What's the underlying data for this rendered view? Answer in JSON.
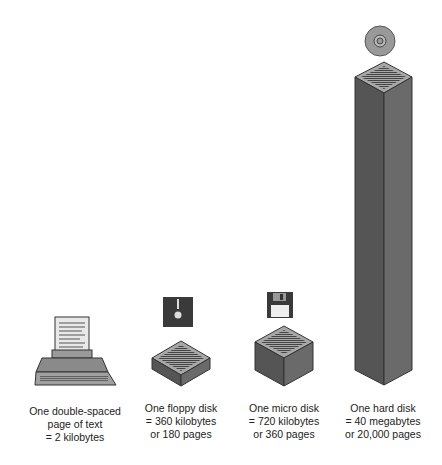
{
  "items": [
    {
      "name": "page",
      "lines": [
        "One double-spaced",
        "page of text",
        "= 2 kilobytes"
      ],
      "kilobytes": 2,
      "pages": 1
    },
    {
      "name": "floppy",
      "lines": [
        "One floppy disk",
        "= 360 kilobytes",
        "or 180 pages"
      ],
      "kilobytes": 360,
      "pages": 180
    },
    {
      "name": "micro",
      "lines": [
        "One micro disk",
        "= 720 kilobytes",
        "or 360 pages"
      ],
      "kilobytes": 720,
      "pages": 360
    },
    {
      "name": "hard",
      "lines": [
        "One hard disk",
        "= 40 megabytes",
        "or 20,000 pages"
      ],
      "kilobytes": 40000,
      "pages": 20000
    }
  ],
  "colors": {
    "block_side_dark": "#555555",
    "block_side_light": "#6a6a6a",
    "block_top": "#a8a8a8",
    "icon_dark": "#3a3a3a"
  }
}
